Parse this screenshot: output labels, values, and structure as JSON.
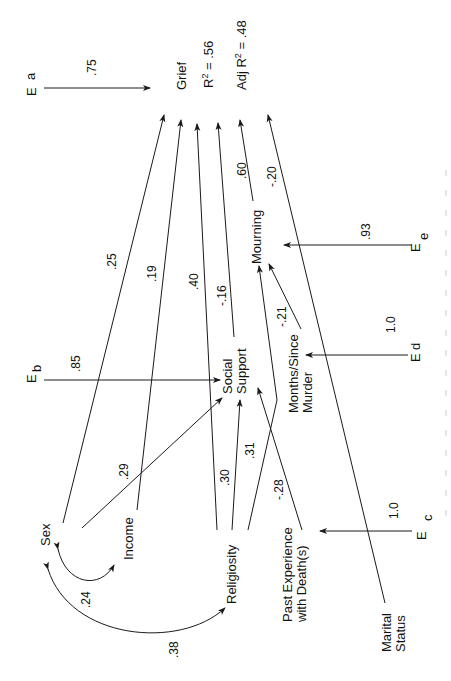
{
  "diagram": {
    "orientation": "rotated -90deg (landscape path model printed sideways)",
    "nodes": {
      "grief": "Grief",
      "r2": "R",
      "r2_sup": "2",
      "r2_value": " = .56",
      "adj_r2_prefix": "Adj R",
      "adj_r2_sup": "2",
      "adj_r2_value": " = .48",
      "social_support_1": "Social",
      "social_support_2": "Support",
      "mourning": "Mourning",
      "months_1": "Months/Since",
      "months_2": "Murder",
      "past_exp_1": "Past Experience",
      "past_exp_2": "with Death(s)",
      "religiosity": "Religiosity",
      "income": "Income",
      "sex": "Sex",
      "marital_1": "Marital",
      "marital_2": "Status"
    },
    "errors": {
      "ea_E": "E",
      "ea_sub": "a",
      "ea_coef": ".75",
      "eb_E": "E",
      "eb_sub": "b",
      "eb_coef": ".85",
      "ec_E": "E",
      "ec_sub": "c",
      "ec_coef": "1.0",
      "ed_E": "E",
      "ed_sub": "d",
      "ed_coef": "1.0",
      "ee_E": "E",
      "ee_sub": "e",
      "ee_coef": ".93"
    },
    "paths": {
      "sex_grief": ".25",
      "income_grief": ".19",
      "religiosity_grief": ".40",
      "social_support_grief": "-.16",
      "mourning_grief": ".60",
      "marital_grief": "-.20",
      "sex_social_support": ".29",
      "religiosity_social_support": ".30",
      "religiosity_mourning": ".31",
      "past_exp_social_support": "-.28",
      "months_mourning": "-.21",
      "sex_income_corr": ".24",
      "sex_religiosity_corr": ".38"
    }
  }
}
